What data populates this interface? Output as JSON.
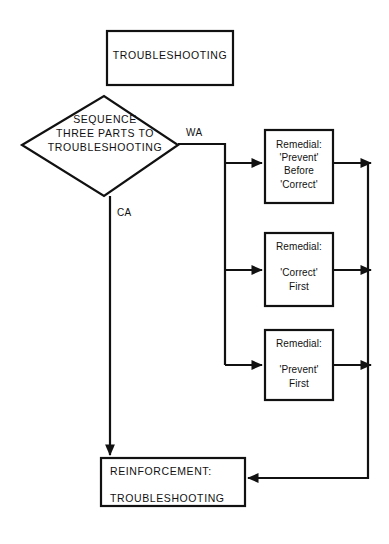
{
  "diagram": {
    "type": "flowchart",
    "title_node": {
      "shape": "rectangle",
      "text": "TROUBLESHOOTING"
    },
    "decision_node": {
      "shape": "diamond",
      "line1": "SEQUENCE",
      "line2": "THREE PARTS TO",
      "line3": "TROUBLESHOOTING"
    },
    "edge_labels": {
      "wrong_answer": "WA",
      "correct_answer": "CA"
    },
    "remedial_nodes": [
      {
        "shape": "rectangle",
        "line1": "Remedial:",
        "line2": "'Prevent'",
        "line3": "Before",
        "line4": "'Correct'"
      },
      {
        "shape": "rectangle",
        "line1": "Remedial:",
        "line2": "",
        "line3": "'Correct'",
        "line4": "First"
      },
      {
        "shape": "rectangle",
        "line1": "Remedial:",
        "line2": "",
        "line3": "'Prevent'",
        "line4": "First"
      }
    ],
    "terminal_node": {
      "shape": "rectangle",
      "line1": "REINFORCEMENT:",
      "line2": "TROUBLESHOOTING"
    },
    "colors": {
      "stroke": "#111111",
      "fill": "#ffffff",
      "background": "#ffffff"
    }
  }
}
